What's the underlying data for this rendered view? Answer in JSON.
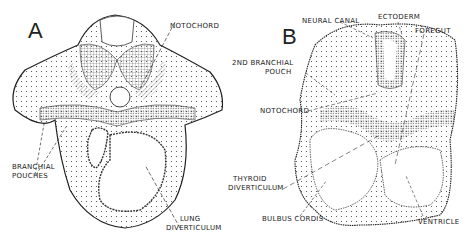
{
  "figure": {
    "panels": [
      {
        "id": "A",
        "letter": "A",
        "labels": {
          "notochord": "NOTOCHORD",
          "branchial_1": "BRANCHIAL",
          "branchial_2": "POUCHES",
          "lung_1": "LUNG",
          "lung_2": "DIVERTICULUM"
        }
      },
      {
        "id": "B",
        "letter": "B",
        "labels": {
          "neural_canal": "NEURAL CANAL",
          "ectoderm": "ECTODERM",
          "foregut": "FOREGUT",
          "branchial_1": "2ND BRANCHIAL",
          "branchial_2": "POUCH",
          "notochord": "NOTOCHORD",
          "thyroid_1": "THYROID",
          "thyroid_2": "DIVERTICULUM",
          "bulbus": "BULBUS CORDIS",
          "ventricle": "VENTRICLE"
        }
      }
    ]
  }
}
